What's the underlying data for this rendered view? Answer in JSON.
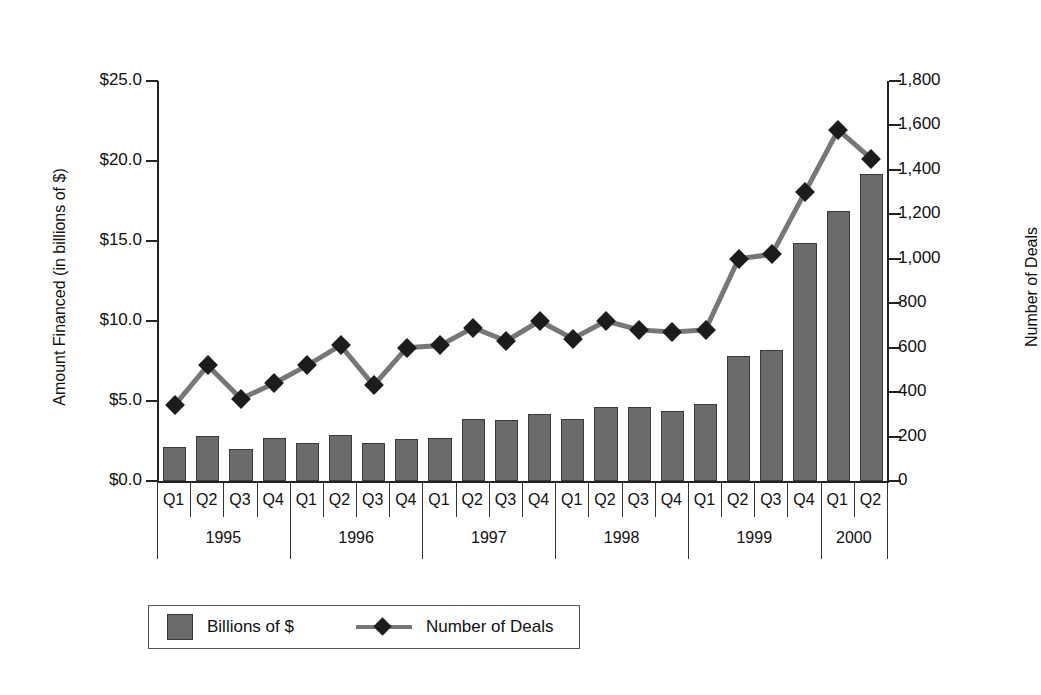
{
  "chart_data": {
    "type": "bar",
    "title": "",
    "xlabel": "",
    "ylabel": "Amount Financed (in billions of $)",
    "y2label": "Number of Deals",
    "grid": false,
    "legend_position": "bottom",
    "ylim": [
      0,
      25
    ],
    "y2lim": [
      0,
      1800
    ],
    "y_ticks": [
      "$0.0",
      "$5.0",
      "$10.0",
      "$15.0",
      "$20.0",
      "$25.0"
    ],
    "y_tick_values": [
      0,
      5,
      10,
      15,
      20,
      25
    ],
    "y2_ticks": [
      "0",
      "200",
      "400",
      "600",
      "800",
      "1,000",
      "1,200",
      "1,400",
      "1,600",
      "1,800"
    ],
    "y2_tick_values": [
      0,
      200,
      400,
      600,
      800,
      1000,
      1200,
      1400,
      1600,
      1800
    ],
    "categories": [
      "Q1",
      "Q2",
      "Q3",
      "Q4",
      "Q1",
      "Q2",
      "Q3",
      "Q4",
      "Q1",
      "Q2",
      "Q3",
      "Q4",
      "Q1",
      "Q2",
      "Q3",
      "Q4",
      "Q1",
      "Q2",
      "Q3",
      "Q4",
      "Q1",
      "Q2"
    ],
    "year_groups": [
      {
        "label": "1995",
        "start": 0,
        "count": 4
      },
      {
        "label": "1996",
        "start": 4,
        "count": 4
      },
      {
        "label": "1997",
        "start": 8,
        "count": 4
      },
      {
        "label": "1998",
        "start": 12,
        "count": 4
      },
      {
        "label": "1999",
        "start": 16,
        "count": 4
      },
      {
        "label": "2000",
        "start": 20,
        "count": 2
      }
    ],
    "series": [
      {
        "name": "Billions of $",
        "type": "bar",
        "axis": "left",
        "color": "#6b6b6b",
        "values": [
          2.1,
          2.8,
          2.0,
          2.7,
          2.4,
          2.9,
          2.4,
          2.6,
          2.7,
          3.9,
          3.8,
          4.2,
          3.9,
          4.6,
          4.6,
          4.4,
          4.8,
          7.8,
          8.2,
          14.9,
          16.9,
          19.2
        ]
      },
      {
        "name": "Number of Deals",
        "type": "line",
        "axis": "right",
        "color": "#1c1c1c",
        "marker": "diamond",
        "values": [
          340,
          520,
          370,
          440,
          520,
          610,
          430,
          600,
          610,
          690,
          630,
          720,
          640,
          720,
          680,
          670,
          680,
          1000,
          1020,
          1300,
          1580,
          1450
        ]
      }
    ]
  },
  "legend": {
    "items": [
      {
        "label": "Billions of $",
        "glyph": "square-swatch"
      },
      {
        "label": "Number of Deals",
        "glyph": "line-diamond"
      }
    ]
  }
}
